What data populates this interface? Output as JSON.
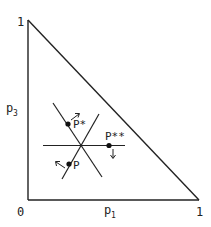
{
  "diagram": {
    "type": "probability-simplex",
    "axes": {
      "x_label": "p",
      "x_label_sub": "1",
      "y_label": "p",
      "y_label_sub": "3",
      "origin_label": "0",
      "x_max_label": "1",
      "y_max_label": "1"
    },
    "points": [
      {
        "id": "p_star",
        "label": "P*",
        "arrow": "up-right"
      },
      {
        "id": "p",
        "label": "P",
        "arrow": "up-left"
      },
      {
        "id": "p_star_star",
        "label": "P**",
        "arrow": "down"
      }
    ],
    "colors": {
      "line": "#222222",
      "background": "#ffffff"
    }
  }
}
